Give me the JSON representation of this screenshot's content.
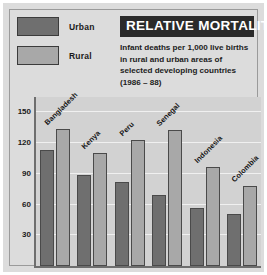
{
  "title": "RELATIVE MORTALITY",
  "subtitle": "Infant deaths per 1,000 live births in rural and urban areas of selected developing countries (1986 – 88)",
  "legend": {
    "items": [
      {
        "label": "Urban",
        "color": "#6f6f6f"
      },
      {
        "label": "Rural",
        "color": "#a8a8a8"
      }
    ]
  },
  "chart_data": {
    "type": "bar",
    "title": "RELATIVE MORTALITY",
    "subtitle": "Infant deaths per 1,000 live births in rural and urban areas of selected developing countries (1986 – 88)",
    "xlabel": "",
    "ylabel": "",
    "ylim": [
      0,
      165
    ],
    "yticks": [
      30,
      60,
      90,
      120,
      150
    ],
    "ytick_labels": [
      "30",
      "60",
      "90",
      "120",
      "150"
    ],
    "grid": true,
    "legend_position": "top-left",
    "categories": [
      "Bangladesh",
      "Kenya",
      "Peru",
      "Senegal",
      "Indonesia",
      "Colombia"
    ],
    "series": [
      {
        "name": "Urban",
        "color": "#6f6f6f",
        "values": [
          113,
          89,
          82,
          69,
          57,
          51
        ]
      },
      {
        "name": "Rural",
        "color": "#a8a8a8",
        "values": [
          134,
          110,
          123,
          133,
          97,
          78
        ]
      }
    ]
  }
}
